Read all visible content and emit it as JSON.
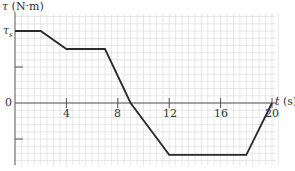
{
  "chart_data": {
    "type": "line",
    "title": "",
    "xlabel": "t (s)",
    "ylabel": "τ (N·m)",
    "x_ticks": [
      "4",
      "8",
      "12",
      "16",
      "20"
    ],
    "y_ticks": [
      "τs",
      "0"
    ],
    "xlim": [
      0,
      20
    ],
    "ylim_units_of_tau_s": [
      -0.9,
      1.0
    ],
    "grid": true,
    "legend": null,
    "series": [
      {
        "name": "torque",
        "x": [
          0,
          2,
          4,
          7,
          9,
          12,
          18,
          20
        ],
        "y_in_tau_s": [
          1.0,
          1.0,
          0.75,
          0.75,
          0.0,
          -0.72,
          -0.72,
          0.0
        ]
      }
    ]
  },
  "labels": {
    "y_axis_symbol": "τ",
    "y_axis_unit": "(N·m)",
    "x_axis_symbol": "t",
    "x_axis_unit": "(s)",
    "tau_s_label": "τ",
    "tau_s_sub": "s",
    "zero_label": "0",
    "tick_4": "4",
    "tick_8": "8",
    "tick_12": "12",
    "tick_16": "16",
    "tick_20": "20"
  }
}
